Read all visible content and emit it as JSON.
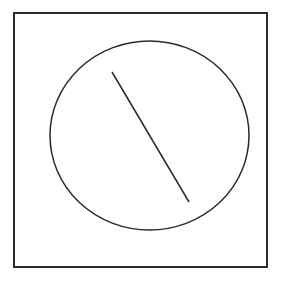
{
  "diagram": {
    "background": "#ffffff",
    "stroke_color": "#2a2a2a",
    "frame": {
      "x": 14,
      "y": 13,
      "width": 253,
      "height": 254,
      "stroke_width": 2
    },
    "ellipse": {
      "cx": 149.5,
      "cy": 135.5,
      "rx": 99.5,
      "ry": 94.5,
      "stroke_width": 1.5
    },
    "line": {
      "x1": 112,
      "y1": 72,
      "x2": 189,
      "y2": 202,
      "stroke_width": 1.5
    }
  }
}
